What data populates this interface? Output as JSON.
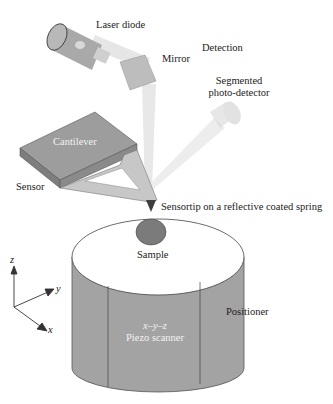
{
  "labels": {
    "laser_diode": "Laser diode",
    "mirror": "Mirror",
    "detection": "Detection",
    "segmented_line1": "Segmented",
    "segmented_line2": "photo-detector",
    "cantilever": "Cantilever",
    "sensor": "Sensor",
    "sensortip": "Sensortip on a reflective coated spring",
    "sample": "Sample",
    "positioner": "Positioner",
    "piezo_line1": "x–y–z",
    "piezo_line2": "Piezo scanner"
  },
  "axes": {
    "z": "z",
    "y": "y",
    "x": "x"
  },
  "colors": {
    "body_gray": "#9a9a9a",
    "dark_gray": "#6f6f6f",
    "light_gray": "#c4c4c4",
    "beam": "#e4e4e4",
    "tip": "#4a4a4a",
    "sample": "#7a7a7a"
  }
}
